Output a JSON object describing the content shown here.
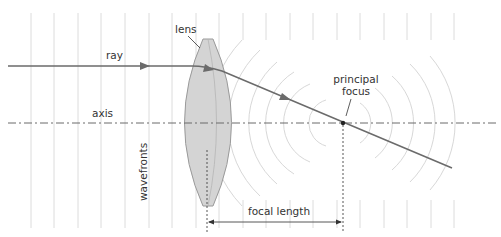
{
  "diagram": {
    "labels": {
      "lens": "lens",
      "ray": "ray",
      "axis": "axis",
      "principal_focus_line1": "principal",
      "principal_focus_line2": "focus",
      "wavefronts": "wavefronts",
      "focal_length": "focal length"
    },
    "colors": {
      "ray": "#6b6b6b",
      "lens_fill": "#d4d4d4",
      "lens_stroke": "#9a9a9a",
      "wavefront": "#dcdcdc",
      "axis": "#6b6b6b",
      "focus_dot": "#222222",
      "text": "#333333"
    },
    "geometry": {
      "axis_y": 123,
      "focus_point": [
        343,
        123
      ],
      "lens_center_x": 208,
      "focal_length_px": 135
    }
  }
}
